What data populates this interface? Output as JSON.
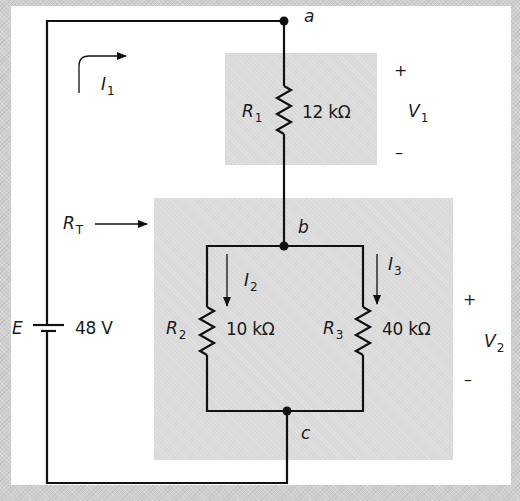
{
  "diagram": {
    "type": "series-parallel circuit",
    "source": {
      "symbol": "E",
      "value": "48 V"
    },
    "nodes": {
      "a": "a",
      "b": "b",
      "c": "c"
    },
    "resistors": [
      {
        "name": "R",
        "sub": "1",
        "value": "12 kΩ"
      },
      {
        "name": "R",
        "sub": "2",
        "value": "10 kΩ"
      },
      {
        "name": "R",
        "sub": "3",
        "value": "40 kΩ"
      }
    ],
    "currents": [
      {
        "name": "I",
        "sub": "1"
      },
      {
        "name": "I",
        "sub": "2"
      },
      {
        "name": "I",
        "sub": "3"
      }
    ],
    "voltages": [
      {
        "name": "V",
        "sub": "1",
        "plus": "+",
        "minus": "–"
      },
      {
        "name": "V",
        "sub": "2",
        "plus": "+",
        "minus": "–"
      }
    ],
    "total_resistance": {
      "name": "R",
      "sub": "T"
    },
    "colors": {
      "wire": "#111111",
      "shade": "#d9d9d9",
      "panel": "#ffffff",
      "background": "#cfcfcf"
    }
  }
}
